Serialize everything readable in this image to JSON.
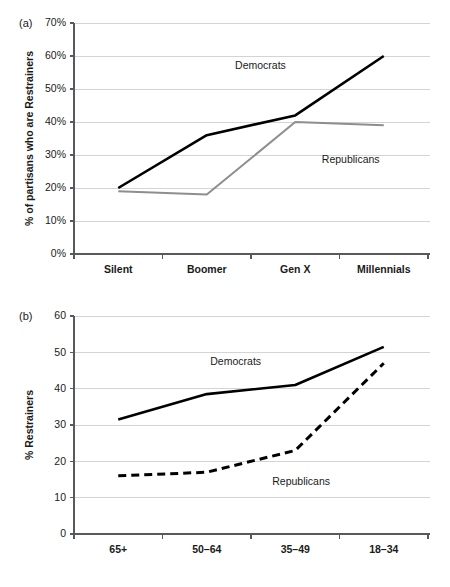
{
  "figure": {
    "panel_a_tag": "(a)",
    "panel_b_tag": "(b)"
  },
  "chart_data": [
    {
      "id": "panel-a",
      "type": "line",
      "title": "",
      "panel_label": "(a)",
      "xlabel": "",
      "ylabel": "% of partisans who are Restrainers",
      "categories": [
        "Silent",
        "Boomer",
        "Gen X",
        "Millennials"
      ],
      "ylim": [
        0,
        70
      ],
      "ytick_values": [
        0,
        10,
        20,
        30,
        40,
        50,
        60,
        70
      ],
      "ytick_labels": [
        "0%",
        "10%",
        "20%",
        "30%",
        "40%",
        "50%",
        "60%",
        "70%"
      ],
      "grid": true,
      "legend_position": "inline-annotations",
      "series": [
        {
          "name": "Democrats",
          "values": [
            20,
            36,
            42,
            60
          ],
          "color": "#000000",
          "style": "solid",
          "width": 2.6,
          "annotation": "Democrats"
        },
        {
          "name": "Republicans",
          "values": [
            19,
            18,
            40,
            39
          ],
          "color": "#8e8e90",
          "style": "solid",
          "width": 2.0,
          "annotation": "Republicans"
        }
      ],
      "annotations": [
        {
          "text": "Democrats",
          "x_frac": 0.455,
          "y_value": 56.0
        },
        {
          "text": "Republicans",
          "x_frac": 0.7,
          "y_value": 27.5
        }
      ]
    },
    {
      "id": "panel-b",
      "type": "line",
      "title": "",
      "panel_label": "(b)",
      "xlabel": "",
      "ylabel": "% Restrainers",
      "categories": [
        "65+",
        "50–64",
        "35–49",
        "18–34"
      ],
      "ylim": [
        0,
        60
      ],
      "ytick_values": [
        0,
        10,
        20,
        30,
        40,
        50,
        60
      ],
      "ytick_labels": [
        "0",
        "10",
        "20",
        "30",
        "40",
        "50",
        "60"
      ],
      "grid": true,
      "legend_position": "inline-annotations",
      "series": [
        {
          "name": "Democrats",
          "values": [
            31.5,
            38.5,
            41,
            51.5
          ],
          "color": "#000000",
          "style": "solid",
          "width": 2.6,
          "annotation": "Democrats"
        },
        {
          "name": "Republicans",
          "values": [
            16,
            17,
            23,
            47
          ],
          "color": "#000000",
          "style": "dashed",
          "width": 3.0,
          "dash": "8,5",
          "annotation": "Republicans"
        }
      ],
      "annotations": [
        {
          "text": "Democrats",
          "x_frac": 0.385,
          "y_value": 46.5
        },
        {
          "text": "Republicans",
          "x_frac": 0.56,
          "y_value": 13.5
        }
      ]
    }
  ]
}
